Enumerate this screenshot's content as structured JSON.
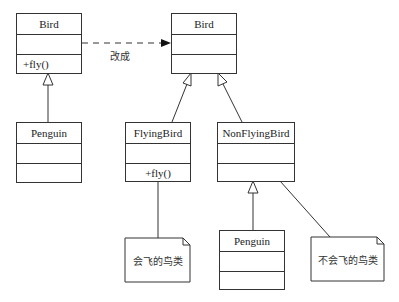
{
  "diagram": {
    "type": "uml-class-diagram",
    "left": {
      "bird": {
        "name": "Bird",
        "attributes": "",
        "operations": "+fly()"
      },
      "penguin": {
        "name": "Penguin",
        "attributes": "",
        "operations": ""
      }
    },
    "transform_label": "改成",
    "right": {
      "bird": {
        "name": "Bird",
        "attributes": "",
        "operations": ""
      },
      "flying_bird": {
        "name": "FlyingBird",
        "attributes": "",
        "operations": "+fly()"
      },
      "non_flying_bird": {
        "name": "NonFlyingBird",
        "attributes": "",
        "operations": ""
      },
      "penguin": {
        "name": "Penguin",
        "attributes": "",
        "operations": ""
      },
      "notes": {
        "flying_note": "会飞的鸟类",
        "non_flying_note": "不会飞的鸟类"
      }
    },
    "relations": [
      {
        "from": "left.penguin",
        "to": "left.bird",
        "type": "generalization"
      },
      {
        "from": "right.flying_bird",
        "to": "right.bird",
        "type": "generalization"
      },
      {
        "from": "right.non_flying_bird",
        "to": "right.bird",
        "type": "generalization"
      },
      {
        "from": "right.penguin",
        "to": "right.non_flying_bird",
        "type": "generalization"
      },
      {
        "from": "left.bird",
        "to": "right.bird",
        "type": "dashed-arrow",
        "label": "改成"
      },
      {
        "from": "right.flying_bird",
        "to": "right.notes.flying_note",
        "type": "note-link"
      },
      {
        "from": "right.non_flying_bird",
        "to": "right.notes.non_flying_note",
        "type": "note-link"
      }
    ]
  }
}
